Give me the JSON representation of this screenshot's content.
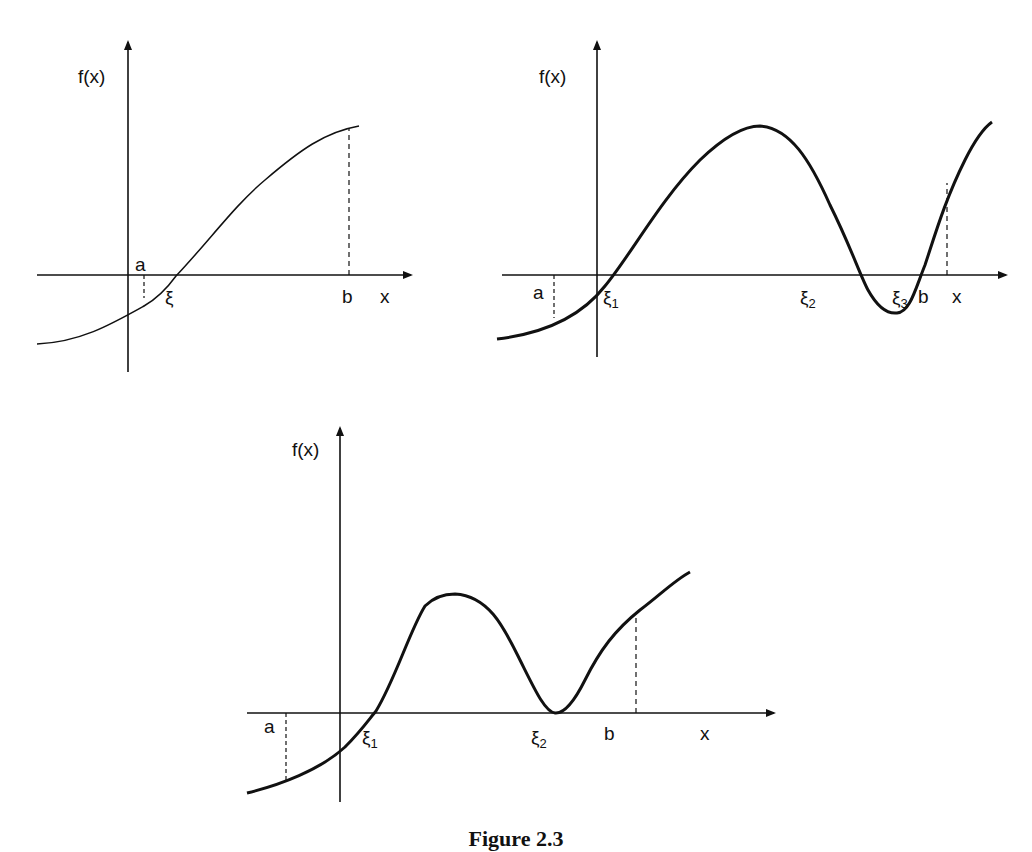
{
  "panels": [
    {
      "id": "top-left",
      "y_label": "f(x)",
      "x_label": "x",
      "labels": {
        "a": "a",
        "b": "b",
        "root1": "ξ"
      },
      "description": "Monotonic increasing curve with single root ξ between a and b"
    },
    {
      "id": "top-right",
      "y_label": "f(x)",
      "x_label": "x",
      "labels": {
        "a": "a",
        "b": "b",
        "root1": "ξ",
        "root1_sub": "1",
        "root2": "ξ",
        "root2_sub": "2",
        "root3": "ξ",
        "root3_sub": "3"
      },
      "description": "Oscillating curve with three roots ξ1, ξ2, ξ3 in [a,b]"
    },
    {
      "id": "bottom",
      "y_label": "f(x)",
      "x_label": "x",
      "labels": {
        "a": "a",
        "b": "b",
        "root1": "ξ",
        "root1_sub": "1",
        "root2": "ξ",
        "root2_sub": "2"
      },
      "description": "Curve with simple root ξ1 and double root (tangent) ξ2 in [a,b]"
    }
  ],
  "caption": "Figure 2.3"
}
